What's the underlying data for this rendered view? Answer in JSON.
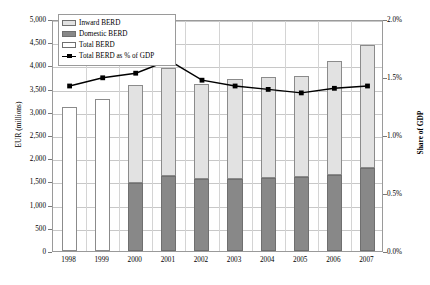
{
  "chart_data": {
    "type": "bar",
    "title": "",
    "subtitle": "",
    "xlabel": "",
    "ylabel": "EUR (millions)",
    "ylabel_right": "Share of GDP",
    "categories": [
      "1998",
      "1999",
      "2000",
      "2001",
      "2002",
      "2003",
      "2004",
      "2005",
      "2006",
      "2007"
    ],
    "ylim": [
      0,
      5000
    ],
    "ytick_labels": [
      "0",
      "500",
      "1,000",
      "1,500",
      "2,000",
      "2,500",
      "3,000",
      "3,500",
      "4,000",
      "4,500",
      "5,000"
    ],
    "ytick_values": [
      0,
      500,
      1000,
      1500,
      2000,
      2500,
      3000,
      3500,
      4000,
      4500,
      5000
    ],
    "ylim_right": [
      0,
      2.0
    ],
    "ytick_labels_right": [
      "0.0%",
      "0.5%",
      "1.0%",
      "1.5%",
      "2.0%"
    ],
    "ytick_values_right": [
      0,
      0.5,
      1.0,
      1.5,
      2.0
    ],
    "grid": true,
    "legend_position": "top-left",
    "stacked": true,
    "series": [
      {
        "name": "Domestic BERD",
        "type": "bar",
        "color": "#888888",
        "values": [
          null,
          null,
          1460,
          1610,
          1545,
          1545,
          1575,
          1605,
          1630,
          1790
        ]
      },
      {
        "name": "Inward BERD",
        "type": "bar",
        "color": "#e2e2e2",
        "values": [
          null,
          null,
          2110,
          2340,
          2055,
          2155,
          2185,
          2175,
          2465,
          2650
        ]
      },
      {
        "name": "Total BERD",
        "type": "bar",
        "color": "#ffffff",
        "values": [
          3100,
          3285,
          3570,
          3950,
          3600,
          3700,
          3760,
          3780,
          4095,
          4440
        ]
      },
      {
        "name": "Total BERD as % of GDP",
        "type": "line",
        "color": "#000000",
        "axis": "right",
        "values": [
          1.44,
          1.51,
          1.55,
          1.66,
          1.49,
          1.44,
          1.41,
          1.38,
          1.42,
          1.44
        ]
      }
    ]
  },
  "legend": {
    "items": [
      {
        "label": "Inward BERD",
        "swatch": "inward"
      },
      {
        "label": "Domestic BERD",
        "swatch": "domestic"
      },
      {
        "label": "Total BERD",
        "swatch": "total"
      },
      {
        "label": "Total BERD as % of GDP",
        "swatch": "line"
      }
    ]
  },
  "axes": {
    "left_title": "EUR (millions)",
    "right_title": "Share of GDP"
  },
  "colors": {
    "inward": "#e2e2e2",
    "domestic": "#888888",
    "total": "#ffffff",
    "line": "#000000",
    "grid": "#c8c8c8",
    "frame": "#9a9a9a"
  }
}
